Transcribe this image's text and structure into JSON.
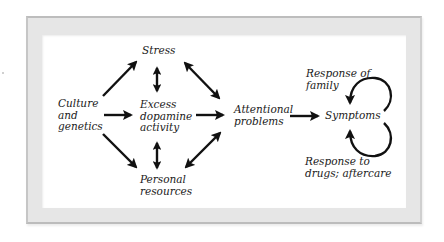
{
  "diagram": {
    "nodes": {
      "culture": {
        "label": "Culture\nand\ngenetics"
      },
      "stress": {
        "label": "Stress"
      },
      "dopamine": {
        "label": "Excess\ndopamine\nactivity"
      },
      "personal": {
        "label": "Personal\nresources"
      },
      "attentional": {
        "label": "Attentional\nproblems"
      },
      "symptoms": {
        "label": "Symptoms"
      },
      "family": {
        "label": "Response of\nfamily"
      },
      "drugs": {
        "label": "Response to\ndrugs; aftercare"
      }
    },
    "edges": [
      {
        "from": "Culture and genetics",
        "to": "Stress",
        "type": "single"
      },
      {
        "from": "Culture and genetics",
        "to": "Excess dopamine activity",
        "type": "single"
      },
      {
        "from": "Culture and genetics",
        "to": "Personal resources",
        "type": "single"
      },
      {
        "from": "Stress",
        "to": "Excess dopamine activity",
        "type": "double"
      },
      {
        "from": "Excess dopamine activity",
        "to": "Personal resources",
        "type": "double"
      },
      {
        "from": "Stress",
        "to": "Attentional problems",
        "type": "double"
      },
      {
        "from": "Excess dopamine activity",
        "to": "Attentional problems",
        "type": "single"
      },
      {
        "from": "Personal resources",
        "to": "Attentional problems",
        "type": "double"
      },
      {
        "from": "Attentional problems",
        "to": "Symptoms",
        "type": "single"
      },
      {
        "from": "Response of family",
        "to": "Symptoms",
        "type": "feedback-loop"
      },
      {
        "from": "Response to drugs; aftercare",
        "to": "Symptoms",
        "type": "feedback-loop"
      }
    ],
    "colors": {
      "arrow": "#111111",
      "frame": "#e6e6e6",
      "frame_edge": "#bdbdbd",
      "panel": "#ffffff"
    }
  }
}
